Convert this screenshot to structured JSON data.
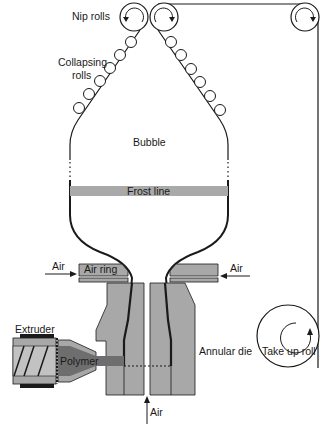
{
  "diagram": {
    "type": "blown film extrusion process",
    "labels": {
      "nip_rolls": "Nip rolls",
      "collapsing_rolls_line1": "Collapsing",
      "collapsing_rolls_line2": "rolls",
      "bubble": "Bubble",
      "frost_line": "Frost line",
      "air_left": "Air",
      "air_ring": "Air ring",
      "air_right": "Air",
      "extruder": "Extruder",
      "polymer": "Polymer",
      "annular_die": "Annular die",
      "air_bottom": "Air",
      "take_up_roll": "Take up roll"
    },
    "colors": {
      "line": "#1a1a1a",
      "gray_fill": "#a8a8a8",
      "dark_gray": "#6e6e6e",
      "frost_band": "#a9a9a9",
      "background": "#ffffff"
    }
  }
}
